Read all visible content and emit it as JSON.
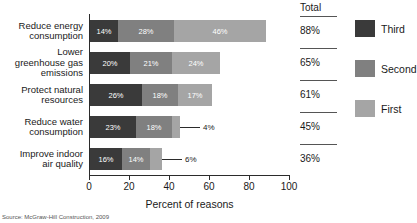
{
  "chart_data": {
    "type": "bar",
    "orientation": "horizontal",
    "stacked": true,
    "title": "",
    "xlabel": "Percent of reasons",
    "ylabel": "",
    "xlim": [
      0,
      100
    ],
    "grid": false,
    "legend_position": "right",
    "categories": [
      "Reduce energy consumption",
      "Lower greenhouse gas emissions",
      "Protect natural resources",
      "Reduce water consumption",
      "Improve indoor air quality"
    ],
    "category_lines": [
      [
        "Reduce energy",
        "consumption"
      ],
      [
        "Lower",
        "greenhouse gas",
        "emissions"
      ],
      [
        "Protect natural",
        "resources"
      ],
      [
        "Reduce water",
        "consumption"
      ],
      [
        "Improve indoor",
        "air quality"
      ]
    ],
    "series": [
      {
        "name": "Third",
        "color": "#3a3a3a",
        "values": [
          14,
          20,
          26,
          23,
          16
        ]
      },
      {
        "name": "Second",
        "color": "#808080",
        "values": [
          28,
          21,
          18,
          18,
          14
        ]
      },
      {
        "name": "First",
        "color": "#a5a5a5",
        "values": [
          46,
          24,
          17,
          4,
          6
        ]
      }
    ],
    "value_labels": [
      [
        "14%",
        "28%",
        "46%"
      ],
      [
        "20%",
        "21%",
        "24%"
      ],
      [
        "26%",
        "18%",
        "17%"
      ],
      [
        "23%",
        "18%",
        "4%"
      ],
      [
        "16%",
        "14%",
        "6%"
      ]
    ],
    "totals": [
      "88%",
      "65%",
      "61%",
      "45%",
      "36%"
    ],
    "xticks": [
      0,
      20,
      40,
      60,
      80,
      100
    ],
    "xtick_labels": [
      "0",
      "20",
      "40",
      "60",
      "80",
      "100"
    ]
  },
  "total_column": {
    "header": "Total",
    "values": [
      "88%",
      "65%",
      "61%",
      "45%",
      "36%"
    ]
  },
  "legend": {
    "items": [
      {
        "label": "Third",
        "color": "#3a3a3a"
      },
      {
        "label": "Second",
        "color": "#808080"
      },
      {
        "label": "First",
        "color": "#a5a5a5"
      }
    ]
  },
  "axis": {
    "xlabel": "Percent of reasons",
    "xtick_labels": [
      "0",
      "20",
      "40",
      "60",
      "80",
      "100"
    ]
  },
  "source": {
    "text": "Source: McGraw-Hill Construction, 2009"
  },
  "colors": {
    "third": "#3a3a3a",
    "second": "#808080",
    "first": "#a5a5a5",
    "axis": "#2b2b2b",
    "text": "#1a1a1a",
    "background": "#ffffff"
  }
}
